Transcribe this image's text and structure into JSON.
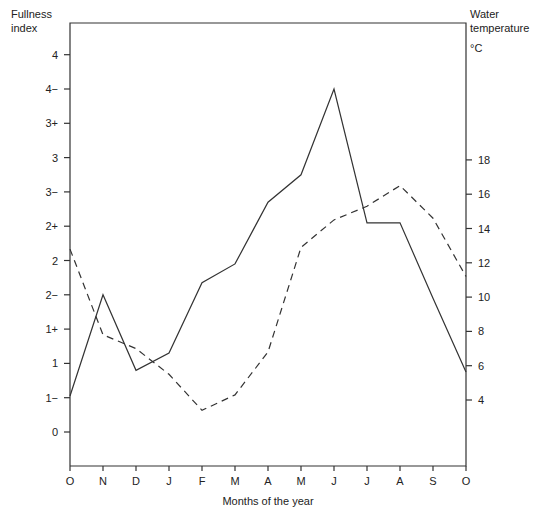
{
  "chart_data": {
    "type": "line",
    "title": "",
    "xlabel": "Months of the year",
    "ylabel_left": "Fullness index",
    "ylabel_right": "Water temperature °C",
    "categories": [
      "O",
      "N",
      "D",
      "J",
      "F",
      "M",
      "A",
      "M",
      "J",
      "J",
      "A",
      "S",
      "O"
    ],
    "left_axis": {
      "title_line1": "Fullness",
      "title_line2": "index",
      "ticks": [
        "0",
        "1−",
        "1",
        "1+",
        "2−",
        "2",
        "2+",
        "3−",
        "3",
        "3+",
        "4−",
        "4"
      ],
      "note": "ordinal scale, tick index 0..11"
    },
    "right_axis": {
      "title_line1": "Water",
      "title_line2": "temperature",
      "unit": "°C",
      "ticks": [
        4,
        6,
        8,
        10,
        12,
        14,
        16,
        18
      ],
      "ylim": [
        4,
        18
      ]
    },
    "series": [
      {
        "name": "Fullness index",
        "style": "solid",
        "axis": "left",
        "values_tick_index": [
          1.05,
          4.0,
          1.8,
          2.3,
          4.35,
          4.9,
          6.7,
          7.5,
          10.0,
          6.1,
          6.1,
          3.9,
          1.75
        ],
        "values_label_approx": [
          "1−",
          "2−",
          "1",
          "1+",
          "2−",
          "2",
          "3−",
          "3",
          "4−",
          "2+",
          "2+",
          "2−",
          "1"
        ]
      },
      {
        "name": "Water temperature",
        "style": "dashed",
        "axis": "right",
        "values": [
          12.8,
          7.8,
          7.0,
          5.5,
          3.4,
          4.3,
          6.8,
          12.9,
          14.5,
          15.3,
          16.5,
          14.6,
          11.2
        ]
      }
    ],
    "grid": false,
    "legend": null
  },
  "labels": {
    "left_title_1": "Fullness",
    "left_title_2": "index",
    "right_title_1": "Water",
    "right_title_2": "temperature",
    "right_unit": "°C",
    "xlabel": "Months of the year"
  }
}
